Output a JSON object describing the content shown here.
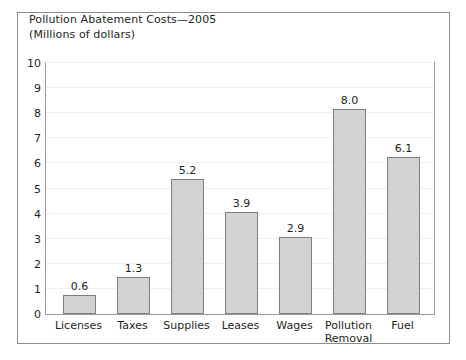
{
  "chart_data": {
    "type": "bar",
    "title": "Pollution Abatement Costs—2005",
    "subtitle": "(Millions of dollars)",
    "xlabel": "",
    "ylabel": "",
    "ylim": [
      0,
      10
    ],
    "yticks": [
      0,
      1,
      2,
      3,
      4,
      5,
      6,
      7,
      8,
      9,
      10
    ],
    "ytick_labels": [
      "0",
      "1",
      "2",
      "3",
      "4",
      "5",
      "6",
      "7",
      "8",
      "9",
      "10"
    ],
    "grid": true,
    "legend": "none",
    "categories": [
      "Licenses",
      "Taxes",
      "Supplies",
      "Leases",
      "Wages",
      "Pollution Removal",
      "Fuel"
    ],
    "category_lines": [
      [
        "Licenses"
      ],
      [
        "Taxes"
      ],
      [
        "Supplies"
      ],
      [
        "Leases"
      ],
      [
        "Wages"
      ],
      [
        "Pollution",
        "Removal"
      ],
      [
        "Fuel"
      ]
    ],
    "values": [
      0.6,
      1.3,
      5.2,
      3.9,
      2.9,
      8.0,
      6.1
    ],
    "value_labels": [
      "0.6",
      "1.3",
      "5.2",
      "3.9",
      "2.9",
      "8.0",
      "6.1"
    ],
    "bar_fill": "#d3d3d1",
    "bar_edge": "#7d7d7d",
    "grid_color": "#efefef",
    "frame_color": "#9a9a9a",
    "border_color": "#8c8c8c",
    "text_color": "#231f20"
  }
}
